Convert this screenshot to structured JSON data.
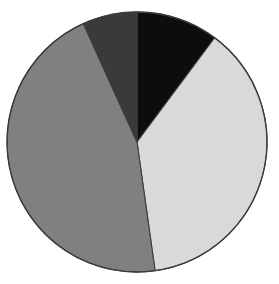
{
  "chart_data": {
    "type": "pie",
    "title": "",
    "subtitle": "",
    "xlabel": "",
    "ylabel": "",
    "grid": false,
    "legend": "none",
    "start_angle_deg": 0,
    "direction": "clockwise",
    "center": {
      "x": 137,
      "y": 142
    },
    "radius": 130,
    "background_color": "#FFFFFF",
    "border_color": "#3C3C3C",
    "categories": [
      "Slice 1",
      "Slice 2",
      "Slice 3",
      "Slice 4"
    ],
    "values": [
      10.2,
      37.5,
      45.5,
      6.8
    ],
    "slices": [
      {
        "label": "Slice 1",
        "value": 10.2,
        "percent": "10.2%",
        "color": "#0D0D0D",
        "color_name": "black",
        "start_angle_deg": 0,
        "end_angle_deg": 36.7
      },
      {
        "label": "Slice 2",
        "value": 37.5,
        "percent": "37.5%",
        "color": "#D9D9D9",
        "color_name": "light-gray",
        "start_angle_deg": 36.7,
        "end_angle_deg": 172.0
      },
      {
        "label": "Slice 3",
        "value": 45.5,
        "percent": "45.5%",
        "color": "#808080",
        "color_name": "medium-gray",
        "start_angle_deg": 172.0,
        "end_angle_deg": 335.6
      },
      {
        "label": "Slice 4",
        "value": 6.8,
        "percent": "6.8%",
        "color": "#3A3A3A",
        "color_name": "dark-gray",
        "start_angle_deg": 335.6,
        "end_angle_deg": 360.0
      }
    ]
  }
}
